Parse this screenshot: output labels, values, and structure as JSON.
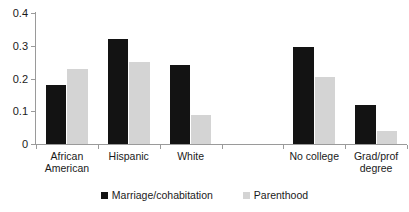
{
  "chart_data": {
    "type": "bar",
    "title": "",
    "subtitle": "",
    "xlabel": "",
    "ylabel": "",
    "ylim": [
      0,
      0.4
    ],
    "yticks": [
      "0",
      "0.1",
      "0.2",
      "0.3",
      "0.4"
    ],
    "ytick_values": [
      0,
      0.1,
      0.2,
      0.3,
      0.4
    ],
    "grid": false,
    "legend_position": "bottom-center",
    "categories": [
      "African\nAmerican",
      "Hispanic",
      "White",
      "",
      "No college",
      "Grad/prof\ndegree"
    ],
    "series": [
      {
        "name": "Marriage/cohabitation",
        "color": "#131313",
        "values": [
          0.18,
          0.32,
          0.24,
          null,
          0.295,
          0.12
        ]
      },
      {
        "name": "Parenthood",
        "color": "#d4d4d4",
        "values": [
          0.23,
          0.25,
          0.088,
          null,
          0.205,
          0.04
        ]
      }
    ]
  },
  "legend": {
    "items": [
      {
        "label": "Marriage/cohabitation",
        "swatch": "dark-square-icon"
      },
      {
        "label": "Parenthood",
        "swatch": "light-square-icon"
      }
    ]
  },
  "axes": {
    "y": {
      "labels": [
        "0.4",
        "0.3",
        "0.2",
        "0.1",
        "0"
      ]
    },
    "x": {
      "labels": [
        "African\nAmerican",
        "Hispanic",
        "White",
        "",
        "No college",
        "Grad/prof\ndegree"
      ]
    }
  }
}
